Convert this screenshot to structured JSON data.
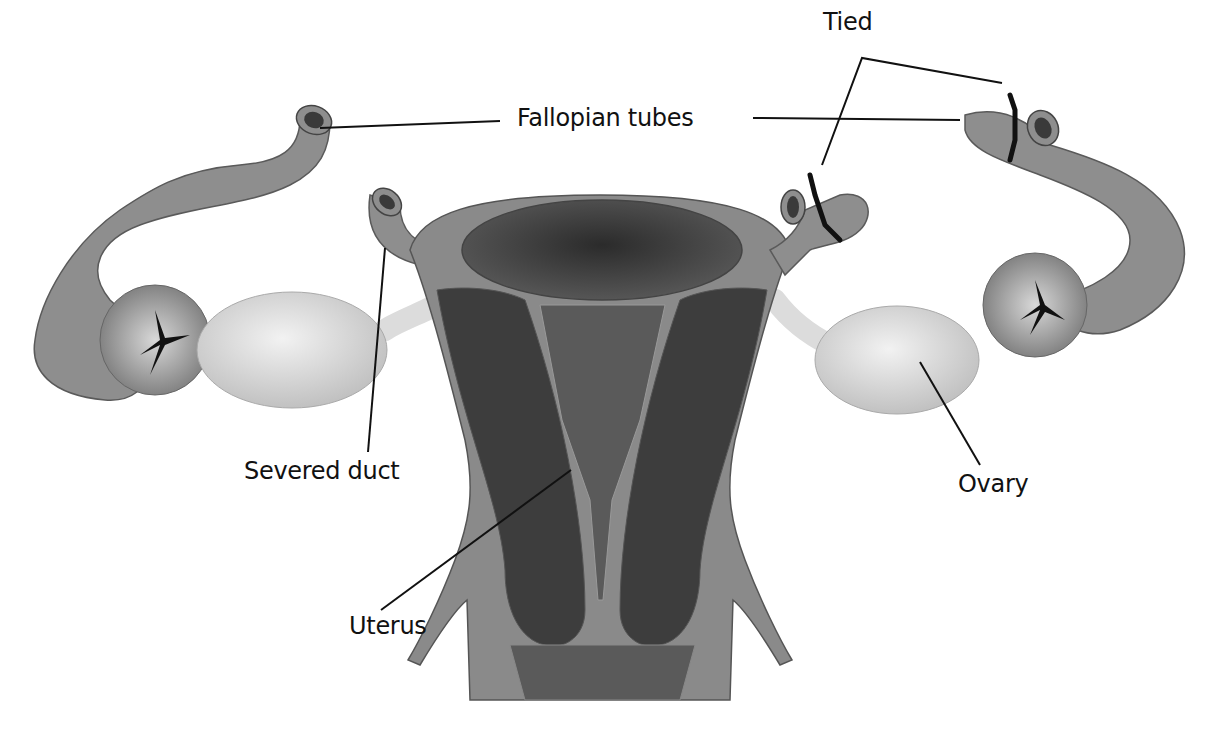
{
  "figure": {
    "labels": {
      "tied": "Tied",
      "fallopian_tubes": "Fallopian tubes",
      "severed_duct": "Severed duct",
      "ovary": "Ovary",
      "uterus": "Uterus"
    },
    "colors": {
      "tube": "#8e8e8e",
      "tube_dark": "#555555",
      "uterus_wall": "#8a8a8a",
      "cavity": "#3a3a3a",
      "ovary": "#dcdcdc",
      "ligature": "#111111",
      "background": "#ffffff"
    }
  }
}
